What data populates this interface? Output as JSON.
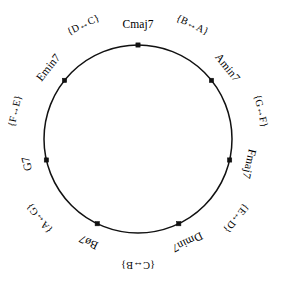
{
  "figure": {
    "title": "",
    "shape": "circle",
    "background_color": "#ffffff",
    "stroke_color": "#111111"
  },
  "chart_data": {
    "type": "diagram",
    "layout": "circular",
    "title": "",
    "center": [
      138,
      139
    ],
    "radius": 94,
    "node_count": 7,
    "start_angle_deg": 90,
    "direction": "clockwise",
    "nodes": [
      {
        "label": "Cmaj7",
        "angle_deg": 90.0,
        "x": 138.0,
        "y": 45.0,
        "label_anchor": "top"
      },
      {
        "label": "Amin7",
        "angle_deg": 38.6,
        "x": 211.4,
        "y": 80.4,
        "label_anchor": "upper-right"
      },
      {
        "label": "Fmaj7",
        "angle_deg": -12.9,
        "x": 229.6,
        "y": 160.0,
        "label_anchor": "right"
      },
      {
        "label": "Dmin7",
        "angle_deg": -64.3,
        "x": 178.7,
        "y": 223.7,
        "label_anchor": "lower-right"
      },
      {
        "label": "Bø7",
        "angle_deg": -115.7,
        "x": 97.3,
        "y": 223.7,
        "label_anchor": "lower-left"
      },
      {
        "label": "G7",
        "angle_deg": -167.1,
        "x": 46.4,
        "y": 160.0,
        "label_anchor": "left"
      },
      {
        "label": "Emin7",
        "angle_deg": 141.4,
        "x": 64.6,
        "y": 80.4,
        "label_anchor": "upper-left"
      }
    ],
    "edge_labels": [
      {
        "label": "{B↔A}",
        "between": [
          "Cmaj7",
          "Amin7"
        ],
        "angle_deg": 64.3,
        "x": 189.8,
        "y": 56.4
      },
      {
        "label": "{G↔F}",
        "between": [
          "Amin7",
          "Fmaj7"
        ],
        "angle_deg": 12.9,
        "x": 251.6,
        "y": 113.0
      },
      {
        "label": "{E↔D}",
        "between": [
          "Fmaj7",
          "Dmin7"
        ],
        "angle_deg": -38.6,
        "x": 226.4,
        "y": 209.7
      },
      {
        "label": "{C↔B}",
        "between": [
          "Dmin7",
          "Bø7"
        ],
        "angle_deg": -90.0,
        "x": 138.0,
        "y": 258.0
      },
      {
        "label": "{A↔G}",
        "between": [
          "Bø7",
          "G7"
        ],
        "angle_deg": -141.4,
        "x": 49.6,
        "y": 209.7
      },
      {
        "label": "{F↔E}",
        "between": [
          "G7",
          "Emin7"
        ],
        "angle_deg": 167.1,
        "x": 24.4,
        "y": 113.0
      },
      {
        "label": "{D↔C}",
        "between": [
          "Emin7",
          "Cmaj7"
        ],
        "angle_deg": 115.7,
        "x": 86.2,
        "y": 56.4
      }
    ]
  }
}
